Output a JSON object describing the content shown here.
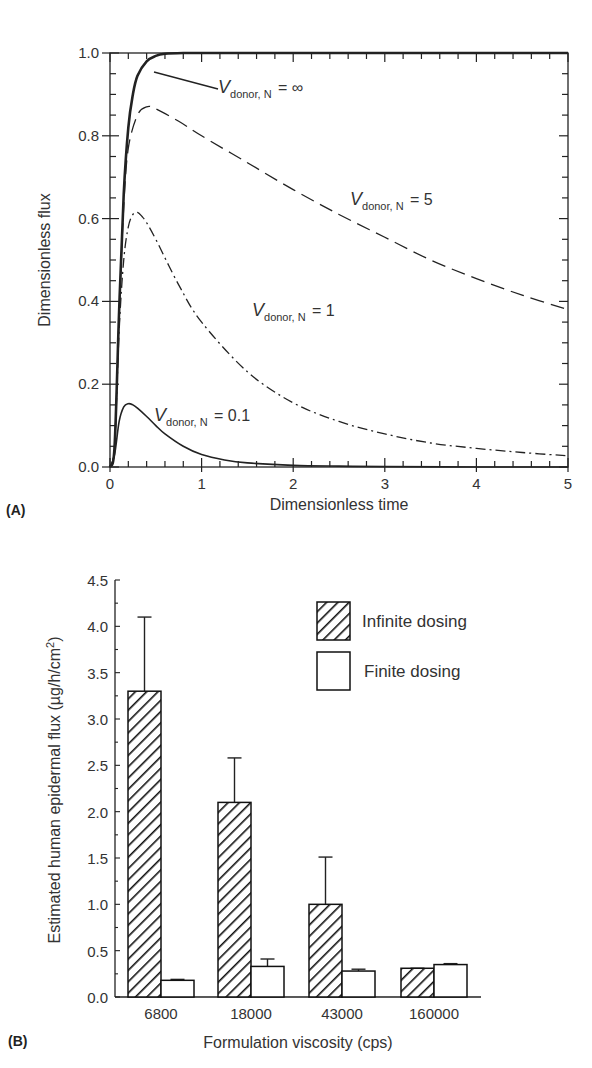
{
  "chart_data": [
    {
      "panel": "(A)",
      "type": "line",
      "title": "",
      "xlabel": "Dimensionless time",
      "ylabel": "Dimensionless flux",
      "xlim": [
        0,
        5
      ],
      "ylim": [
        0,
        1.0
      ],
      "xticks": [
        "0",
        "1",
        "2",
        "3",
        "4",
        "5"
      ],
      "yticks": [
        "0.0",
        "0.2",
        "0.4",
        "0.6",
        "0.8",
        "1.0"
      ],
      "grid": false,
      "series": [
        {
          "name": "V_donor,N = ∞",
          "label_main": "V",
          "label_sub": "donor, N",
          "label_eq": "= ∞",
          "style": "solid-thick",
          "x": [
            0,
            0.05,
            0.1,
            0.15,
            0.2,
            0.25,
            0.3,
            0.4,
            0.5,
            0.6,
            0.8,
            1.0,
            2.0,
            3.0,
            4.0,
            5.0
          ],
          "y": [
            0,
            0.05,
            0.38,
            0.66,
            0.82,
            0.9,
            0.945,
            0.98,
            0.993,
            0.998,
            1.0,
            1.0,
            1.0,
            1.0,
            1.0,
            1.0
          ]
        },
        {
          "name": "V_donor,N = 5",
          "label_main": "V",
          "label_sub": "donor, N",
          "label_eq": "= 5",
          "style": "dashed",
          "x": [
            0,
            0.05,
            0.1,
            0.15,
            0.2,
            0.3,
            0.4,
            0.5,
            0.75,
            1.0,
            1.5,
            2.0,
            2.5,
            3.0,
            3.5,
            4.0,
            4.5,
            5.0
          ],
          "y": [
            0,
            0.05,
            0.37,
            0.63,
            0.77,
            0.85,
            0.87,
            0.865,
            0.835,
            0.8,
            0.735,
            0.67,
            0.61,
            0.555,
            0.5,
            0.455,
            0.415,
            0.38
          ]
        },
        {
          "name": "V_donor,N = 1",
          "label_main": "V",
          "label_sub": "donor, N",
          "label_eq": "= 1",
          "style": "dash-dot",
          "x": [
            0,
            0.05,
            0.1,
            0.15,
            0.2,
            0.25,
            0.3,
            0.35,
            0.4,
            0.5,
            0.75,
            1.0,
            1.5,
            2.0,
            2.5,
            3.0,
            3.5,
            4.0,
            4.5,
            5.0
          ],
          "y": [
            0,
            0.05,
            0.33,
            0.5,
            0.58,
            0.61,
            0.615,
            0.605,
            0.59,
            0.55,
            0.44,
            0.35,
            0.23,
            0.155,
            0.11,
            0.08,
            0.058,
            0.045,
            0.035,
            0.027
          ]
        },
        {
          "name": "V_donor,N = 0.1",
          "label_main": "V",
          "label_sub": "donor, N",
          "label_eq": "= 0.1",
          "style": "solid-thin",
          "x": [
            0,
            0.05,
            0.1,
            0.15,
            0.2,
            0.25,
            0.3,
            0.4,
            0.5,
            0.6,
            0.8,
            1.0,
            1.25,
            1.5,
            2.0,
            2.5,
            3.0,
            4.0,
            5.0
          ],
          "y": [
            0,
            0.03,
            0.11,
            0.145,
            0.153,
            0.15,
            0.142,
            0.122,
            0.1,
            0.08,
            0.05,
            0.03,
            0.017,
            0.01,
            0.004,
            0.002,
            0.001,
            0.0,
            0.0
          ]
        }
      ]
    },
    {
      "panel": "(B)",
      "type": "bar",
      "title": "",
      "xlabel": "Formulation viscosity (cps)",
      "ylabel_main": "Estimated human epidermal flux (µg/h/cm",
      "ylabel_sup": "2",
      "ylabel_end": ")",
      "ylim": [
        0,
        4.5
      ],
      "yticks": [
        "0.0",
        "0.5",
        "1.0",
        "1.5",
        "2.0",
        "2.5",
        "3.0",
        "3.5",
        "4.0",
        "4.5"
      ],
      "categories": [
        "6800",
        "18000",
        "43000",
        "160000"
      ],
      "legend_position": "upper right",
      "grid": false,
      "series": [
        {
          "name": "Infinite dosing",
          "pattern": "hatched",
          "values": [
            3.3,
            2.1,
            1.0,
            0.31
          ],
          "error_upper": [
            4.1,
            2.58,
            1.51,
            0.31
          ]
        },
        {
          "name": "Finite dosing",
          "pattern": "open",
          "values": [
            0.18,
            0.33,
            0.28,
            0.35
          ],
          "error_upper": [
            0.19,
            0.41,
            0.3,
            0.36
          ]
        }
      ]
    }
  ]
}
